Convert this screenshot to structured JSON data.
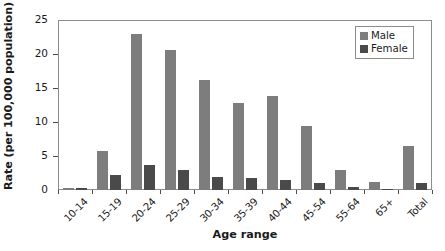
{
  "chart_data": {
    "type": "bar",
    "title": "",
    "xlabel": "Age range",
    "ylabel": "Rate (per 100,000 population)",
    "categories": [
      "10-14",
      "15-19",
      "20-24",
      "25-29",
      "30-34",
      "35-39",
      "40-44",
      "45-54",
      "55-64",
      "65+",
      "Total"
    ],
    "series": [
      {
        "name": "Male",
        "color": "#7d7d7d",
        "values": [
          0.3,
          5.7,
          23.0,
          20.6,
          16.2,
          12.8,
          13.8,
          9.4,
          3.0,
          1.2,
          6.4
        ]
      },
      {
        "name": "Female",
        "color": "#4a4a4a",
        "values": [
          0.3,
          2.2,
          3.7,
          3.0,
          1.9,
          1.7,
          1.5,
          1.0,
          0.5,
          0.1,
          1.0
        ]
      }
    ],
    "ylim": [
      0,
      25
    ],
    "yticks": [
      0,
      5,
      10,
      15,
      20,
      25
    ],
    "ytick_labels": [
      "0",
      "5",
      "10",
      "15",
      "20",
      "25"
    ],
    "grid": false,
    "legend_position": "top-right"
  },
  "legend": {
    "entries": [
      {
        "label": "Male",
        "color": "#7d7d7d"
      },
      {
        "label": "Female",
        "color": "#4a4a4a"
      }
    ]
  },
  "axes": {
    "x_title": "Age range",
    "y_title": "Rate (per 100,000 population)"
  }
}
